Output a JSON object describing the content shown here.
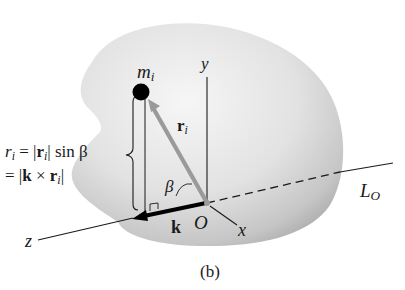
{
  "figure": {
    "caption": "(b)",
    "colors": {
      "body_fill_light": "#f2f2f2",
      "body_fill_dark": "#b8b8b8",
      "line": "#1a1a1a",
      "position_vector": "#9a9a9a",
      "mass_point": "#000000"
    },
    "labels": {
      "mass": {
        "main": "m",
        "sub": "i"
      },
      "y_axis": "y",
      "x_axis": "x",
      "z_axis": "z",
      "origin": "O",
      "axis_line": {
        "main": "L",
        "sub": "O"
      },
      "position_vector": {
        "main": "r",
        "sub": "i"
      },
      "unit_vector": "k",
      "angle": "β"
    },
    "formula": {
      "line1": {
        "lhs_main": "r",
        "lhs_sub": "i",
        "eq": " = |",
        "r_main": "r",
        "r_sub": "i",
        "rest": "| sin β"
      },
      "line2": {
        "eq": "= |",
        "k": "k",
        "cross": " × ",
        "r_main": "r",
        "r_sub": "i",
        "close": "|"
      }
    }
  }
}
